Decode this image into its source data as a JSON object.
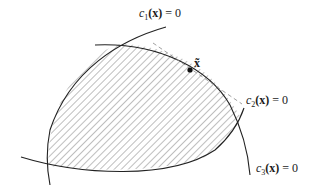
{
  "diagram": {
    "type": "feasible-region",
    "constraints": [
      {
        "name": "c1",
        "label_func": "c",
        "label_sub": "1",
        "label_arg": "(x)",
        "label_rhs": "= 0"
      },
      {
        "name": "c2",
        "label_func": "c",
        "label_sub": "2",
        "label_arg": "(x)",
        "label_rhs": "= 0"
      },
      {
        "name": "c3",
        "label_func": "c",
        "label_sub": "3",
        "label_arg": "(x)",
        "label_rhs": "= 0"
      }
    ],
    "point": {
      "label": "x̃"
    },
    "colors": {
      "line": "#222222",
      "hatch": "#444444",
      "dashed": "#888888"
    }
  }
}
